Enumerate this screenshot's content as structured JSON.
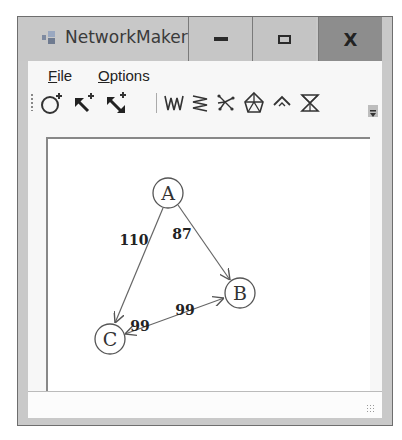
{
  "window": {
    "title": "NetworkMaker",
    "icons": {
      "app": "network-app-icon",
      "minimize": "minimize-icon",
      "maximize": "maximize-icon",
      "close": "close-icon"
    },
    "close_glyph": "X"
  },
  "menu": {
    "items": [
      {
        "label": "File",
        "mnemonic": "F",
        "rest": "ile"
      },
      {
        "label": "Options",
        "mnemonic": "O",
        "rest": "ptions"
      }
    ]
  },
  "toolbar": {
    "tools": [
      {
        "name": "add-node",
        "icon": "circle-plus-icon"
      },
      {
        "name": "add-link",
        "icon": "arrow-plus-icon"
      },
      {
        "name": "add-two-way-link",
        "icon": "double-arrow-plus-icon"
      },
      {
        "name": "layout-grid",
        "icon": "wave-m-icon"
      },
      {
        "name": "layout-zigzag",
        "icon": "zigzag-icon"
      },
      {
        "name": "random-network",
        "icon": "scatter-icon"
      },
      {
        "name": "shortest-path",
        "icon": "network-shape-icon"
      },
      {
        "name": "path-tree",
        "icon": "tree-arrow-icon"
      },
      {
        "name": "hourglass-network",
        "icon": "hourglass-icon"
      }
    ],
    "overflow_icon": "overflow-chevron-icon"
  },
  "network": {
    "nodes": [
      {
        "id": "A",
        "label": "A",
        "x": 120,
        "y": 54
      },
      {
        "id": "B",
        "label": "B",
        "x": 192,
        "y": 154
      },
      {
        "id": "C",
        "label": "C",
        "x": 62,
        "y": 200
      }
    ],
    "links": [
      {
        "from": "A",
        "to": "C",
        "cost": "110",
        "label_x": 86,
        "label_y": 102
      },
      {
        "from": "A",
        "to": "B",
        "cost": "87",
        "label_x": 134,
        "label_y": 96
      },
      {
        "from": "C",
        "to": "B",
        "cost": "99",
        "label_x": 137,
        "label_y": 172
      },
      {
        "from": "B",
        "to": "C",
        "cost": "99",
        "label_x": 92,
        "label_y": 188
      }
    ]
  },
  "status": {
    "text": ""
  }
}
